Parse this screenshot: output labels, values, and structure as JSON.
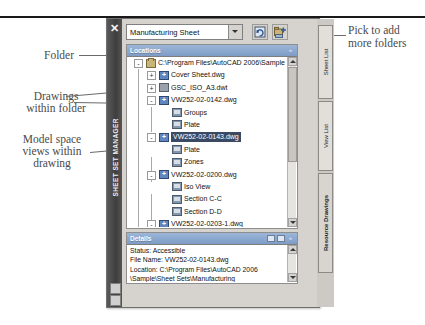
{
  "window": {
    "vertical_title": "SHEET SET MANAGER",
    "close_icon": "✕"
  },
  "toolbar": {
    "sheetset_combo_value": "Manufacturing Sheet",
    "dropdown_icon": "chevron-down",
    "refresh_button_label": "",
    "add_folder_button_label": ""
  },
  "locations": {
    "title": "Locations",
    "collapse_icon": "»",
    "tree": [
      {
        "indent": 0,
        "toggle": "-",
        "icon": "folder",
        "label": "C:\\Program Files\\AutoCAD 2006\\Sample"
      },
      {
        "indent": 1,
        "toggle": "+",
        "icon": "dwg",
        "label": "Cover Sheet.dwg"
      },
      {
        "indent": 1,
        "toggle": "+",
        "icon": "dwt",
        "label": "GSC_ISO_A3.dwt"
      },
      {
        "indent": 1,
        "toggle": "-",
        "icon": "dwg",
        "label": "VW252-02-0142.dwg"
      },
      {
        "indent": 2,
        "toggle": "",
        "icon": "view",
        "label": "Groups"
      },
      {
        "indent": 2,
        "toggle": "",
        "icon": "view",
        "label": "Plate"
      },
      {
        "indent": 1,
        "toggle": "-",
        "icon": "dwg",
        "label": "VW252-02-0143.dwg",
        "selected": true
      },
      {
        "indent": 2,
        "toggle": "",
        "icon": "view",
        "label": "Plate"
      },
      {
        "indent": 2,
        "toggle": "",
        "icon": "view",
        "label": "Zones"
      },
      {
        "indent": 1,
        "toggle": "-",
        "icon": "dwg",
        "label": "VW252-02-0200.dwg"
      },
      {
        "indent": 2,
        "toggle": "",
        "icon": "view",
        "label": "Iso View"
      },
      {
        "indent": 2,
        "toggle": "",
        "icon": "view",
        "label": "Section C-C"
      },
      {
        "indent": 2,
        "toggle": "",
        "icon": "view",
        "label": "Section D-D"
      },
      {
        "indent": 1,
        "toggle": "-",
        "icon": "dwg",
        "label": "VW252-02-0203-1.dwg"
      },
      {
        "indent": 2,
        "toggle": "",
        "icon": "view",
        "label": "Drive Roller"
      },
      {
        "indent": 1,
        "toggle": "+",
        "icon": "dwg",
        "label": "VW252-02-0300.dwg"
      },
      {
        "indent": 1,
        "toggle": "+",
        "icon": "dwg",
        "label": "VW252-02-0500-N.dwg"
      },
      {
        "indent": 1,
        "toggle": "+",
        "icon": "dwt",
        "label": "VW252-02-0500.dwg"
      }
    ]
  },
  "details": {
    "title": "Details",
    "lines": [
      "Status: Accessible",
      "File Name: VW252-02-0143.dwg",
      "Location: C:\\Program Files\\AutoCAD 2006",
      "\\Sample\\Sheet Sets\\Manufacturing"
    ]
  },
  "tabs": [
    {
      "label": "Sheet List",
      "active": false
    },
    {
      "label": "View List",
      "active": false
    },
    {
      "label": "Resource Drawings",
      "active": true
    }
  ],
  "annotations": {
    "folder": "Folder",
    "drawings_within_folder_line1": "Drawings",
    "drawings_within_folder_line2": "within folder",
    "model_space_line1": "Model space",
    "model_space_line2": "views within",
    "model_space_line3": "drawing",
    "pick_to_add_line1": "Pick to add",
    "pick_to_add_line2": "more folders"
  }
}
